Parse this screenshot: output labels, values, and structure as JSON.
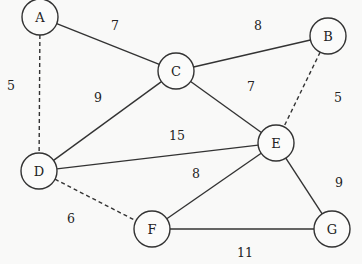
{
  "diagram": {
    "type": "weighted-undirected-graph",
    "nodes": [
      {
        "id": "A",
        "label": "A",
        "x": 40,
        "y": 17
      },
      {
        "id": "B",
        "label": "B",
        "x": 328,
        "y": 36
      },
      {
        "id": "C",
        "label": "C",
        "x": 176,
        "y": 71
      },
      {
        "id": "D",
        "label": "D",
        "x": 39,
        "y": 171
      },
      {
        "id": "E",
        "label": "E",
        "x": 276,
        "y": 143
      },
      {
        "id": "F",
        "label": "F",
        "x": 152,
        "y": 229
      },
      {
        "id": "G",
        "label": "G",
        "x": 332,
        "y": 229
      }
    ],
    "edges": [
      {
        "from": "A",
        "to": "C",
        "weight": "7",
        "style": "solid",
        "label_x": 115,
        "label_y": 25
      },
      {
        "from": "A",
        "to": "D",
        "weight": "5",
        "style": "dashed",
        "label_x": 11,
        "label_y": 85
      },
      {
        "from": "C",
        "to": "B",
        "weight": "8",
        "style": "solid",
        "label_x": 258,
        "label_y": 25
      },
      {
        "from": "C",
        "to": "E",
        "weight": "7",
        "style": "solid",
        "label_x": 251,
        "label_y": 86
      },
      {
        "from": "B",
        "to": "E",
        "weight": "5",
        "style": "dashed",
        "label_x": 338,
        "label_y": 97
      },
      {
        "from": "C",
        "to": "D",
        "weight": "9",
        "style": "solid",
        "label_x": 98,
        "label_y": 97
      },
      {
        "from": "D",
        "to": "E",
        "weight": "15",
        "style": "solid",
        "label_x": 177,
        "label_y": 135
      },
      {
        "from": "E",
        "to": "F",
        "weight": "8",
        "style": "solid",
        "label_x": 196,
        "label_y": 173
      },
      {
        "from": "D",
        "to": "F",
        "weight": "6",
        "style": "dashed",
        "label_x": 71,
        "label_y": 218
      },
      {
        "from": "E",
        "to": "G",
        "weight": "9",
        "style": "solid",
        "label_x": 339,
        "label_y": 182
      },
      {
        "from": "F",
        "to": "G",
        "weight": "11",
        "style": "solid",
        "label_x": 245,
        "label_y": 252
      }
    ]
  }
}
